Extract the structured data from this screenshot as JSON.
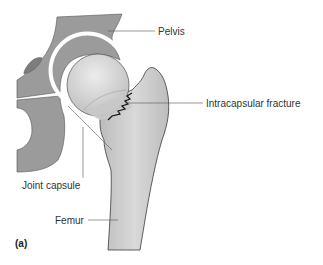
{
  "figure": {
    "panel_label": "(a)",
    "labels": {
      "pelvis": "Pelvis",
      "fracture": "Intracapsular fracture",
      "capsule": "Joint capsule",
      "femur": "Femur"
    },
    "colors": {
      "pelvis": "#9b9b9b",
      "pelvis_dark": "#7d7d7d",
      "femoral_head": "#cfcfcf",
      "femur": "#c6c6c6",
      "capsule": "#ffffff",
      "outline": "#3a3a3a",
      "leader": "#555555"
    }
  }
}
